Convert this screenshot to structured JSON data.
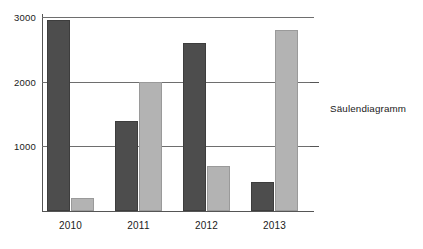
{
  "caption": {
    "text": "Säulendiagramm"
  },
  "chart_data": {
    "type": "bar",
    "title": "",
    "subtitle": "",
    "xlabel": "",
    "ylabel": "",
    "categories": [
      "2010",
      "2011",
      "2012",
      "2013"
    ],
    "series": [
      {
        "name": "dark-series",
        "color": "#4d4d4d",
        "values": [
          2950,
          1400,
          2600,
          450
        ]
      },
      {
        "name": "light-series",
        "color": "#b3b3b3",
        "values": [
          200,
          2000,
          700,
          2800
        ]
      }
    ],
    "ylim": [
      0,
      3050
    ],
    "yticks": [
      1000,
      2000,
      3000
    ],
    "ytick_labels": [
      "1000",
      "2000",
      "3000"
    ],
    "grid": true,
    "grid_axis": "y",
    "legend": false,
    "legend_position": "none",
    "annotations": [
      "Säulendiagramm"
    ]
  },
  "style": {
    "background": "#ffffff",
    "axis_color": "#555555",
    "grid_color": "#6e6e6e",
    "text_color": "#1a1a1a"
  }
}
